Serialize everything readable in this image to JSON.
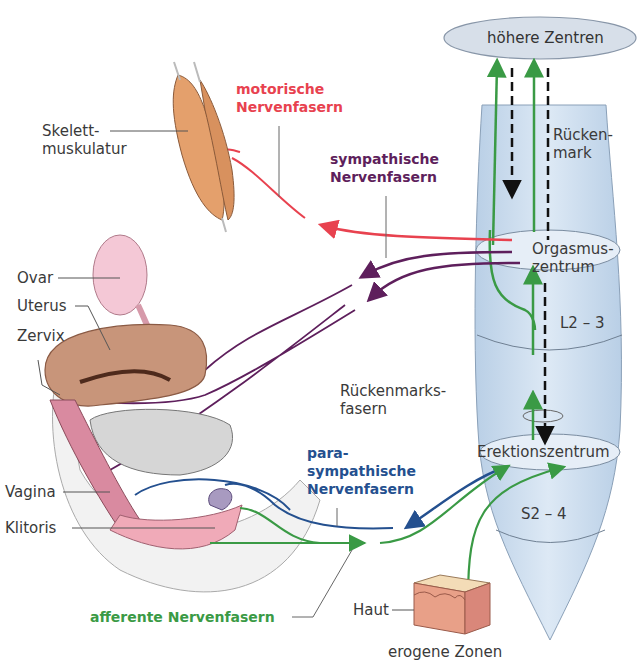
{
  "colors": {
    "motor": "#e8424f",
    "sympathetic": "#5e1f5c",
    "parasympathetic": "#24508f",
    "afferent": "#3a9a45",
    "descending": "#111111",
    "spinal_cord_fill": "#cfe0f0",
    "label": "#3a3a3a"
  },
  "spinal": {
    "higher_centers": "höhere Zentren",
    "spinal_cord": "Rücken-\nmark",
    "orgasm_center": "Orgasmus-\nzentrum",
    "segment_upper": "L2 – 3",
    "spinal_fibers": "Rückenmarks-\nfasern",
    "erection_center": "Erektionszentrum",
    "segment_lower": "S2 – 4"
  },
  "fibers": {
    "motor": "motorische\nNervenfasern",
    "sympathetic": "sympathische\nNervenfasern",
    "parasympathetic": "para-\nsympathische\nNervenfasern",
    "afferent": "afferente Nervenfasern"
  },
  "anatomy": {
    "skeletal_muscle": "Skelett-\nmuskulatur",
    "ovary": "Ovar",
    "uterus": "Uterus",
    "cervix": "Zervix",
    "vagina": "Vagina",
    "clitoris": "Klitoris",
    "skin": "Haut",
    "erogenous_zones": "erogene Zonen"
  }
}
